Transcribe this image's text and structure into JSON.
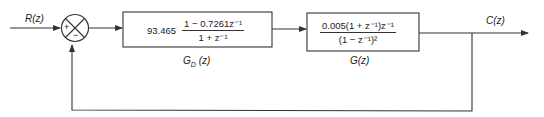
{
  "diagram": {
    "type": "closed-loop block diagram",
    "input": {
      "label": "R(z)"
    },
    "output": {
      "label": "C(z)"
    },
    "summing_junction": {
      "plus_sign": "+",
      "minus_sign": "−"
    },
    "blocks": [
      {
        "id": "controller",
        "label": "G_D (z)",
        "label_main": "G",
        "label_sub": "D",
        "label_arg": "(z)",
        "gain": "93.465",
        "numerator": "1 − 0.7261z⁻¹",
        "denominator": "1 + z⁻¹"
      },
      {
        "id": "plant",
        "label": "G(z)",
        "numerator": "0.005(1 + z⁻¹)z⁻¹",
        "denominator": "(1 − z⁻¹)²"
      }
    ],
    "feedback": {
      "type": "unity negative feedback"
    },
    "colors": {
      "line": "#333333",
      "background": "#ffffff"
    }
  }
}
